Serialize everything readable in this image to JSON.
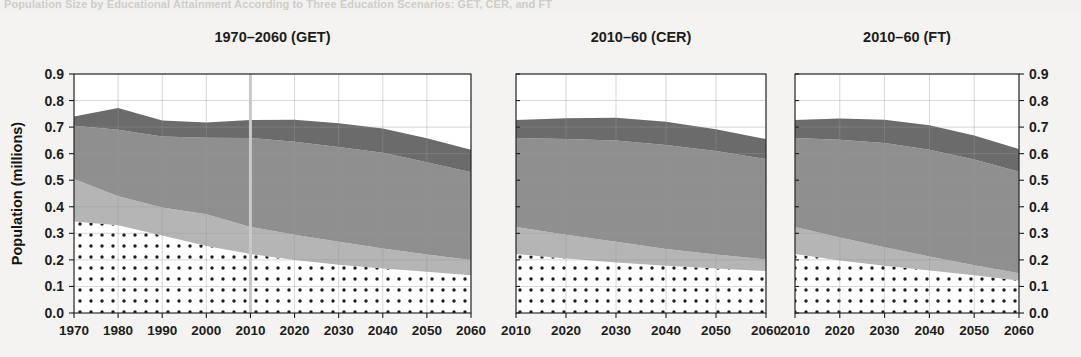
{
  "caption": "Population Size by Educational Attainment According to Three Education Scenarios: GET, CER, and FT",
  "axes": {
    "ylabel": "Population (millions)",
    "yticks": [
      "0.0",
      "0.1",
      "0.2",
      "0.3",
      "0.4",
      "0.5",
      "0.6",
      "0.7",
      "0.8",
      "0.9"
    ],
    "ylim": [
      0.0,
      0.9
    ],
    "ytick_values": [
      0.0,
      0.1,
      0.2,
      0.3,
      0.4,
      0.5,
      0.6,
      0.7,
      0.8,
      0.9
    ]
  },
  "colors": {
    "no_education": "#ffffff",
    "primary": "#b5b5b5",
    "secondary": "#8f8f8f",
    "tertiary": "#6b6b6b",
    "axis": "#1d1d1d",
    "grid": "#9a9a9a",
    "background": "#f4f3f1"
  },
  "chart_data": [
    {
      "type": "area",
      "title": "1970–2060 (GET)",
      "xlabel": "",
      "ylabel": "Population (millions)",
      "xlim": [
        1970,
        2060
      ],
      "ylim": [
        0.0,
        0.9
      ],
      "grid": true,
      "stacked": true,
      "marker_year": 2010,
      "x": [
        1970,
        1980,
        1990,
        2000,
        2010,
        2020,
        2030,
        2040,
        2050,
        2060
      ],
      "xticks": [
        "1970",
        "1980",
        "1990",
        "2000",
        "2010",
        "2020",
        "2030",
        "2040",
        "2050",
        "2060"
      ],
      "series": [
        {
          "name": "No Education",
          "values": [
            0.345,
            0.33,
            0.292,
            0.252,
            0.222,
            0.2,
            0.182,
            0.168,
            0.155,
            0.142
          ]
        },
        {
          "name": "Primary",
          "values": [
            0.16,
            0.11,
            0.105,
            0.12,
            0.102,
            0.095,
            0.086,
            0.075,
            0.065,
            0.058
          ]
        },
        {
          "name": "Secondary",
          "values": [
            0.2,
            0.25,
            0.268,
            0.288,
            0.335,
            0.35,
            0.357,
            0.36,
            0.348,
            0.33
          ]
        },
        {
          "name": "Tertiary",
          "values": [
            0.035,
            0.082,
            0.06,
            0.057,
            0.068,
            0.083,
            0.09,
            0.092,
            0.09,
            0.085
          ]
        }
      ],
      "totals": [
        0.74,
        0.772,
        0.725,
        0.717,
        0.727,
        0.728,
        0.715,
        0.695,
        0.658,
        0.615
      ]
    },
    {
      "type": "area",
      "title": "2010–60 (CER)",
      "xlabel": "",
      "ylabel": "",
      "xlim": [
        2010,
        2060
      ],
      "ylim": [
        0.0,
        0.9
      ],
      "grid": true,
      "stacked": true,
      "marker_year": null,
      "x": [
        2010,
        2020,
        2030,
        2040,
        2050,
        2060
      ],
      "xticks": [
        "2010",
        "2020",
        "2030",
        "2040",
        "2050",
        "2060"
      ],
      "series": [
        {
          "name": "No Education",
          "values": [
            0.222,
            0.205,
            0.19,
            0.178,
            0.168,
            0.158
          ]
        },
        {
          "name": "Primary",
          "values": [
            0.102,
            0.09,
            0.078,
            0.063,
            0.052,
            0.044
          ]
        },
        {
          "name": "Secondary",
          "values": [
            0.335,
            0.36,
            0.382,
            0.392,
            0.39,
            0.378
          ]
        },
        {
          "name": "Tertiary",
          "values": [
            0.068,
            0.078,
            0.085,
            0.087,
            0.082,
            0.075
          ]
        }
      ],
      "totals": [
        0.727,
        0.733,
        0.735,
        0.72,
        0.692,
        0.655
      ]
    },
    {
      "type": "area",
      "title": "2010–60 (FT)",
      "xlabel": "",
      "ylabel": "",
      "xlim": [
        2010,
        2060
      ],
      "ylim": [
        0.0,
        0.9
      ],
      "grid": true,
      "stacked": true,
      "marker_year": null,
      "x": [
        2010,
        2020,
        2030,
        2040,
        2050,
        2060
      ],
      "xticks": [
        "2010",
        "2020",
        "2030",
        "2040",
        "2050",
        "2060"
      ],
      "series": [
        {
          "name": "No Education",
          "values": [
            0.222,
            0.198,
            0.178,
            0.16,
            0.142,
            0.122
          ]
        },
        {
          "name": "Primary",
          "values": [
            0.102,
            0.086,
            0.07,
            0.053,
            0.038,
            0.028
          ]
        },
        {
          "name": "Secondary",
          "values": [
            0.335,
            0.368,
            0.392,
            0.402,
            0.398,
            0.382
          ]
        },
        {
          "name": "Tertiary",
          "values": [
            0.068,
            0.08,
            0.088,
            0.092,
            0.09,
            0.085
          ]
        }
      ],
      "totals": [
        0.727,
        0.732,
        0.728,
        0.707,
        0.668,
        0.617
      ]
    }
  ]
}
